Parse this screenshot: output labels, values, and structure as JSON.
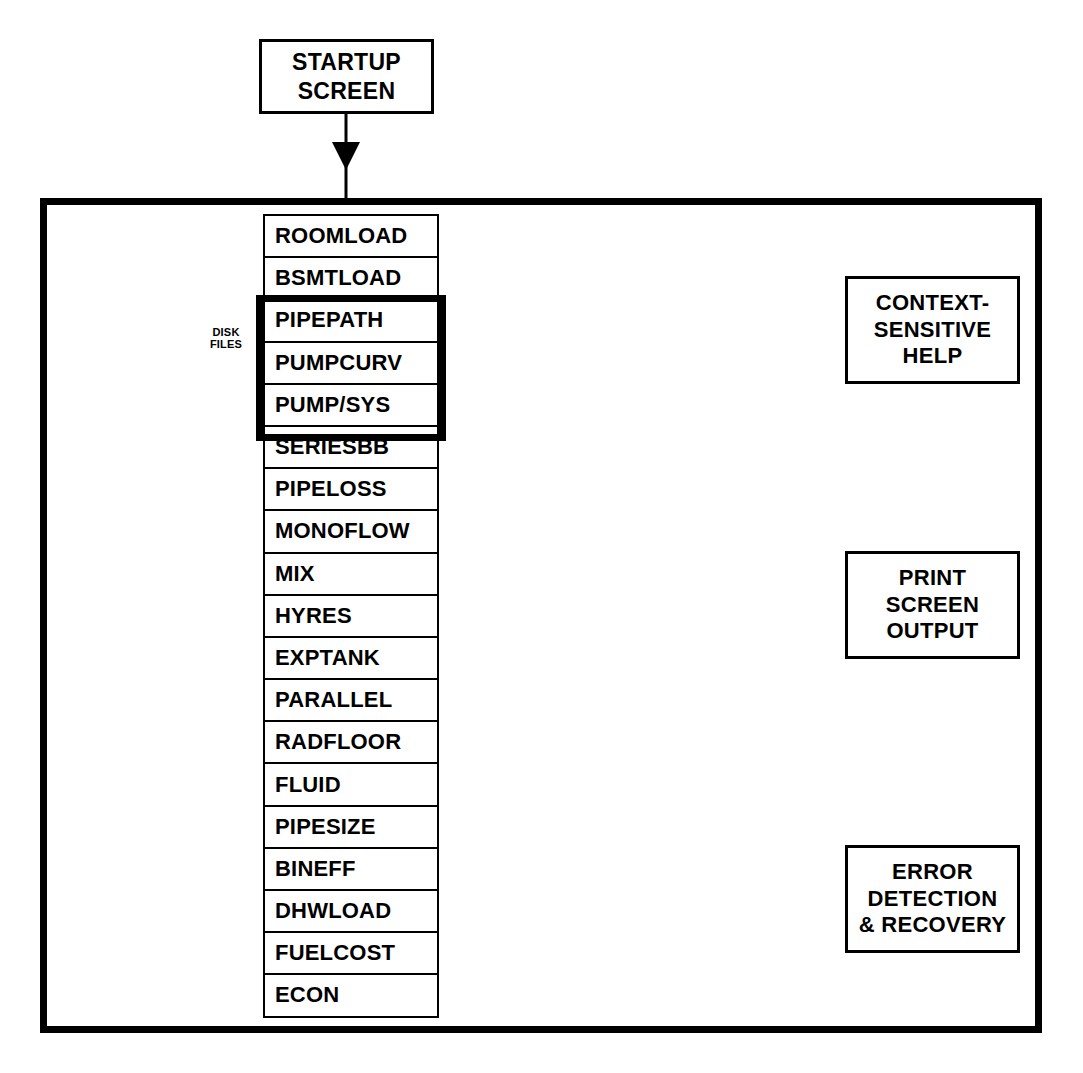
{
  "diagram": {
    "startup": {
      "label": "STARTUP\nSCREEN",
      "line1": "STARTUP",
      "line2": "SCREEN"
    },
    "disk_files": {
      "line1": "DISK",
      "line2": "FILES"
    },
    "menu_items": [
      {
        "label": "ROOMLOAD",
        "highlighted": false
      },
      {
        "label": "BSMTLOAD",
        "highlighted": false
      },
      {
        "label": "PIPEPATH",
        "highlighted": true
      },
      {
        "label": "PUMPCURV",
        "highlighted": true
      },
      {
        "label": "PUMP/SYS",
        "highlighted": true
      },
      {
        "label": "SERIESBB",
        "highlighted": false
      },
      {
        "label": "PIPELOSS",
        "highlighted": false
      },
      {
        "label": "MONOFLOW",
        "highlighted": false
      },
      {
        "label": "MIX",
        "highlighted": false
      },
      {
        "label": "HYRES",
        "highlighted": false
      },
      {
        "label": "EXPTANK",
        "highlighted": false
      },
      {
        "label": "PARALLEL",
        "highlighted": false
      },
      {
        "label": "RADFLOOR",
        "highlighted": false
      },
      {
        "label": "FLUID",
        "highlighted": false
      },
      {
        "label": "PIPESIZE",
        "highlighted": false
      },
      {
        "label": "BINEFF",
        "highlighted": false
      },
      {
        "label": "DHWLOAD",
        "highlighted": false
      },
      {
        "label": "FUELCOST",
        "highlighted": false
      },
      {
        "label": "ECON",
        "highlighted": false
      }
    ],
    "side_boxes": [
      {
        "id": "context-sensitive-help",
        "line1": "CONTEXT-",
        "line2": "SENSITIVE",
        "line3": "HELP",
        "arrow": "double"
      },
      {
        "id": "print-screen-output",
        "line1": "PRINT",
        "line2": "SCREEN",
        "line3": "OUTPUT",
        "arrow": "single-right"
      },
      {
        "id": "error-detection-recovery",
        "line1": "ERROR",
        "line2": "DETECTION",
        "line3": "& RECOVERY",
        "arrow": "double"
      }
    ],
    "colors": {
      "stroke": "#000000",
      "background": "#ffffff",
      "dither": "#333333"
    }
  }
}
